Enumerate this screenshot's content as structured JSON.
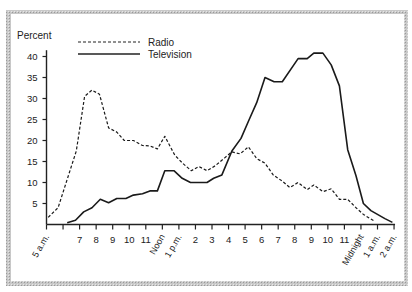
{
  "chart_data": {
    "type": "line",
    "title": "",
    "ylabel": "Percent",
    "xlabel": "",
    "ylim": [
      0,
      40
    ],
    "yticks": [
      5,
      10,
      15,
      20,
      25,
      30,
      35,
      40
    ],
    "xticks": [
      {
        "h": 5,
        "label": "5 a.m.",
        "rotated": true
      },
      {
        "h": 6,
        "label": ""
      },
      {
        "h": 7,
        "label": "7"
      },
      {
        "h": 8,
        "label": "8"
      },
      {
        "h": 9,
        "label": "9"
      },
      {
        "h": 10,
        "label": "10"
      },
      {
        "h": 11,
        "label": "11"
      },
      {
        "h": 12,
        "label": "Noon",
        "rotated": true
      },
      {
        "h": 13,
        "label": "1 p.m.",
        "rotated": true
      },
      {
        "h": 14,
        "label": "2"
      },
      {
        "h": 15,
        "label": "3"
      },
      {
        "h": 16,
        "label": "4"
      },
      {
        "h": 17,
        "label": "5"
      },
      {
        "h": 18,
        "label": "6"
      },
      {
        "h": 19,
        "label": "7"
      },
      {
        "h": 20,
        "label": "8"
      },
      {
        "h": 21,
        "label": "9"
      },
      {
        "h": 22,
        "label": "10"
      },
      {
        "h": 23,
        "label": "11"
      },
      {
        "h": 24,
        "label": "Midnight",
        "rotated": true
      },
      {
        "h": 25,
        "label": "1 a.m.",
        "rotated": true
      },
      {
        "h": 26,
        "label": "2 a.m.",
        "rotated": true
      }
    ],
    "legend": {
      "position": "top-left",
      "entries": [
        "Radio",
        "Television"
      ]
    },
    "grid": false,
    "series": [
      {
        "name": "Radio",
        "style": "dashed",
        "points": [
          [
            5.1,
            1.7
          ],
          [
            5.7,
            4.0
          ],
          [
            6.8,
            17.5
          ],
          [
            7.3,
            30.5
          ],
          [
            7.75,
            32.0
          ],
          [
            8.2,
            31.0
          ],
          [
            8.75,
            23.0
          ],
          [
            9.25,
            22.0
          ],
          [
            9.7,
            20.0
          ],
          [
            10.25,
            20.0
          ],
          [
            10.8,
            18.8
          ],
          [
            11.25,
            18.7
          ],
          [
            11.7,
            18.0
          ],
          [
            12.15,
            21.0
          ],
          [
            12.75,
            16.5
          ],
          [
            13.25,
            14.5
          ],
          [
            13.75,
            12.8
          ],
          [
            14.2,
            13.8
          ],
          [
            14.7,
            12.8
          ],
          [
            15.2,
            14.0
          ],
          [
            15.75,
            15.8
          ],
          [
            16.2,
            17.3
          ],
          [
            16.7,
            16.8
          ],
          [
            17.2,
            18.5
          ],
          [
            17.7,
            15.7
          ],
          [
            18.2,
            14.6
          ],
          [
            18.7,
            11.8
          ],
          [
            19.25,
            10.3
          ],
          [
            19.7,
            8.8
          ],
          [
            20.2,
            10.0
          ],
          [
            20.75,
            8.3
          ],
          [
            21.15,
            9.4
          ],
          [
            21.7,
            7.8
          ],
          [
            22.2,
            8.5
          ],
          [
            22.7,
            6.0
          ],
          [
            23.2,
            6.0
          ],
          [
            23.7,
            4.0
          ],
          [
            24.15,
            2.4
          ],
          [
            24.85,
            0.7
          ]
        ]
      },
      {
        "name": "Television",
        "style": "solid",
        "points": [
          [
            6.25,
            0.4
          ],
          [
            6.75,
            1.0
          ],
          [
            7.25,
            3.0
          ],
          [
            7.75,
            4.0
          ],
          [
            8.25,
            6.0
          ],
          [
            8.75,
            5.2
          ],
          [
            9.25,
            6.2
          ],
          [
            9.8,
            6.2
          ],
          [
            10.25,
            7.0
          ],
          [
            10.8,
            7.3
          ],
          [
            11.25,
            8.0
          ],
          [
            11.7,
            8.0
          ],
          [
            12.15,
            12.8
          ],
          [
            12.7,
            12.8
          ],
          [
            13.2,
            11.0
          ],
          [
            13.7,
            10.0
          ],
          [
            14.7,
            10.0
          ],
          [
            15.1,
            11.0
          ],
          [
            15.6,
            11.8
          ],
          [
            16.2,
            17.5
          ],
          [
            16.75,
            20.5
          ],
          [
            17.25,
            25.0
          ],
          [
            17.7,
            29.0
          ],
          [
            18.2,
            35.0
          ],
          [
            18.75,
            34.0
          ],
          [
            19.25,
            34.0
          ],
          [
            20.2,
            39.5
          ],
          [
            20.75,
            39.5
          ],
          [
            21.15,
            40.8
          ],
          [
            21.7,
            40.8
          ],
          [
            22.2,
            38.0
          ],
          [
            22.7,
            33.0
          ],
          [
            23.2,
            17.8
          ],
          [
            23.7,
            11.6
          ],
          [
            24.15,
            5.0
          ],
          [
            24.6,
            3.3
          ],
          [
            25.45,
            1.4
          ],
          [
            25.9,
            0.5
          ]
        ]
      }
    ]
  },
  "labels": {
    "percent": "Percent",
    "legend_radio": "Radio",
    "legend_tv": "Television"
  }
}
